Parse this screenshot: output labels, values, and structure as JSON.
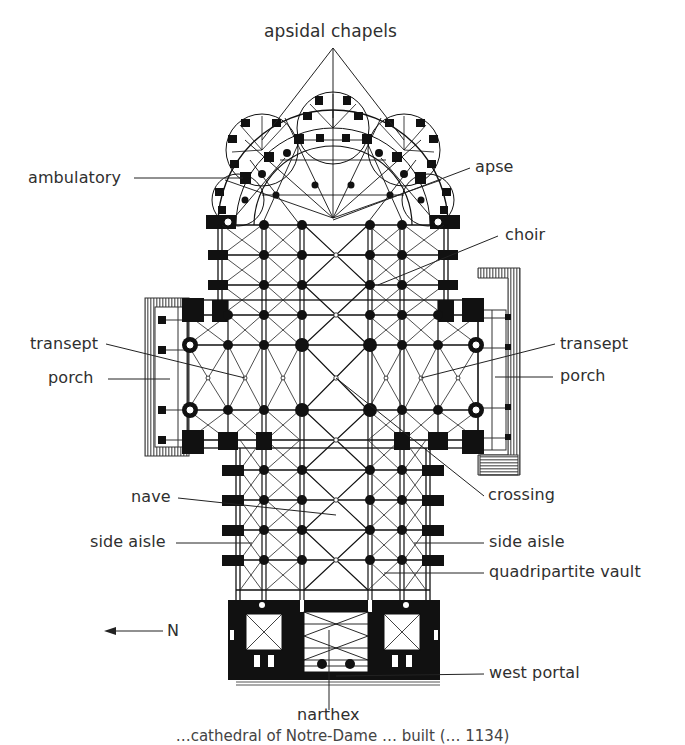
{
  "diagram": {
    "type": "architectural floor plan",
    "colors": {
      "ink": "#111111",
      "label": "#2f2f2f",
      "hatch": "#555555",
      "background": "#ffffff"
    },
    "labels": {
      "apsidal_chapels": "apsidal chapels",
      "ambulatory": "ambulatory",
      "apse": "apse",
      "choir": "choir",
      "transept_left": "transept",
      "porch_left": "porch",
      "transept_right": "transept",
      "porch_right": "porch",
      "crossing": "crossing",
      "nave": "nave",
      "side_aisle_left": "side aisle",
      "side_aisle_right": "side aisle",
      "quadripartite_vault": "quadripartite vault",
      "north_indicator": "N",
      "west_portal": "west portal",
      "narthex": "narthex"
    },
    "caption_fragment": "…cathedral of Notre-Dame … built (… 1134)"
  }
}
